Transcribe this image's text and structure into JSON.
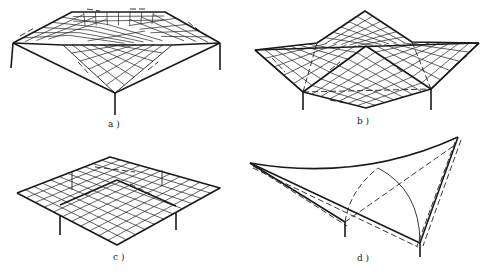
{
  "figure": {
    "panels": [
      {
        "id": "a",
        "label": "a )",
        "description": "Four-point supported hipped lattice shell, deformed shape"
      },
      {
        "id": "b",
        "label": "b )",
        "description": "Folded plate lattice with central peak, deformed shape"
      },
      {
        "id": "c",
        "label": "c )",
        "description": "Flat lattice plate on four supports, deformed shape"
      },
      {
        "id": "d",
        "label": "d )",
        "description": "Hyperbolic paraboloid membrane with dashed deformed outline"
      }
    ]
  }
}
